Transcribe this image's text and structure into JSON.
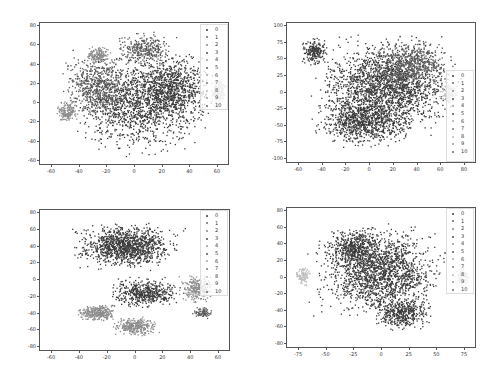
{
  "chart_data": [
    {
      "type": "scatter",
      "title": "",
      "xlabel": "",
      "ylabel": "",
      "xlim": [
        -75,
        75
      ],
      "ylim": [
        -72,
        80
      ],
      "xticks": [
        "-60",
        "-40",
        "-20",
        "0",
        "20",
        "40",
        "60"
      ],
      "yticks": [
        "80",
        "60",
        "40",
        "20",
        "0",
        "-20",
        "-40",
        "-60"
      ],
      "grid": false,
      "legend_position": "upper right",
      "legend": [
        "0",
        "1",
        "2",
        "3",
        "4",
        "5",
        "6",
        "7",
        "8",
        "9",
        "10"
      ],
      "description": "t-SNE embedding with several distinct clusters; light-gray clusters near (-30,35), (-60,-25), and (62,0)"
    },
    {
      "type": "scatter",
      "title": "",
      "xlabel": "",
      "ylabel": "",
      "xlim": [
        -75,
        85
      ],
      "ylim": [
        -105,
        105
      ],
      "xticks": [
        "-60",
        "-40",
        "-20",
        "0",
        "20",
        "40",
        "60",
        "80"
      ],
      "yticks": [
        "100",
        "75",
        "50",
        "25",
        "0",
        "-25",
        "-50",
        "-75",
        "-100"
      ],
      "grid": false,
      "legend_position": "center right",
      "legend": [
        "0",
        "1",
        "2",
        "3",
        "4",
        "5",
        "6",
        "7",
        "8",
        "9",
        "10"
      ],
      "description": "t-SNE embedding forming one large dense mixed blob spanning x -65..70, y -95..95 with a notch on upper-left"
    },
    {
      "type": "scatter",
      "title": "",
      "xlabel": "",
      "ylabel": "",
      "xlim": [
        -75,
        75
      ],
      "ylim": [
        -85,
        85
      ],
      "xticks": [
        "-60",
        "-40",
        "-20",
        "0",
        "20",
        "40",
        "60"
      ],
      "yticks": [
        "80",
        "60",
        "40",
        "20",
        "0",
        "-20",
        "-40",
        "-60",
        "-80"
      ],
      "grid": false,
      "legend_position": "upper right",
      "legend": [
        "0",
        "1",
        "2",
        "3",
        "4",
        "5",
        "6",
        "7",
        "8",
        "9",
        "10"
      ],
      "description": "t-SNE embedding with large dark cluster at top (y 0..80) and lighter gray clusters lower (-40..10, -80..-30) and right (40..60, 0..20)"
    },
    {
      "type": "scatter",
      "title": "",
      "xlabel": "",
      "ylabel": "",
      "xlim": [
        -85,
        95
      ],
      "ylim": [
        -85,
        90
      ],
      "xticks": [
        "-75",
        "-50",
        "-25",
        "0",
        "25",
        "50",
        "75"
      ],
      "yticks": [
        "80",
        "60",
        "40",
        "20",
        "0",
        "-20",
        "-40",
        "-60",
        "-80"
      ],
      "grid": false,
      "legend_position": "upper right",
      "legend": [
        "0",
        "1",
        "2",
        "3",
        "4",
        "5",
        "6",
        "7",
        "8",
        "9",
        "10"
      ],
      "description": "t-SNE embedding with one large dark blob centred near origin, light-gray clusters at left (-70,0) and right (75,0)"
    }
  ],
  "colors": {
    "dark": "#3a3a3a",
    "mid": "#5a5a5a",
    "gray": "#8c8c8c",
    "light": "#bdbdbd",
    "frame": "#555555"
  }
}
